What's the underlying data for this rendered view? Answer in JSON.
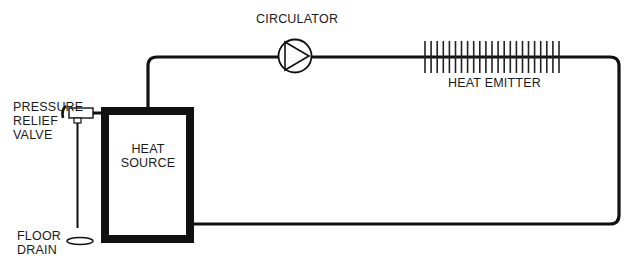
{
  "diagram": {
    "labels": {
      "circulator": "CIRCULATOR",
      "heat_emitter": "HEAT EMITTER",
      "pressure_relief_valve": [
        "PRESSURE",
        "RELIEF",
        "VALVE"
      ],
      "heat_source": [
        "HEAT",
        "SOURCE"
      ],
      "floor_drain": [
        "FLOOR",
        "DRAIN"
      ]
    },
    "components": [
      {
        "id": "heat-source",
        "type": "boiler-box"
      },
      {
        "id": "circulator",
        "type": "pump-symbol"
      },
      {
        "id": "heat-emitter",
        "type": "finned-tube",
        "fin_count": 23
      },
      {
        "id": "pressure-relief-valve",
        "type": "valve"
      },
      {
        "id": "floor-drain",
        "type": "drain"
      }
    ],
    "colors": {
      "line": "#111111",
      "background": "#ffffff"
    }
  }
}
